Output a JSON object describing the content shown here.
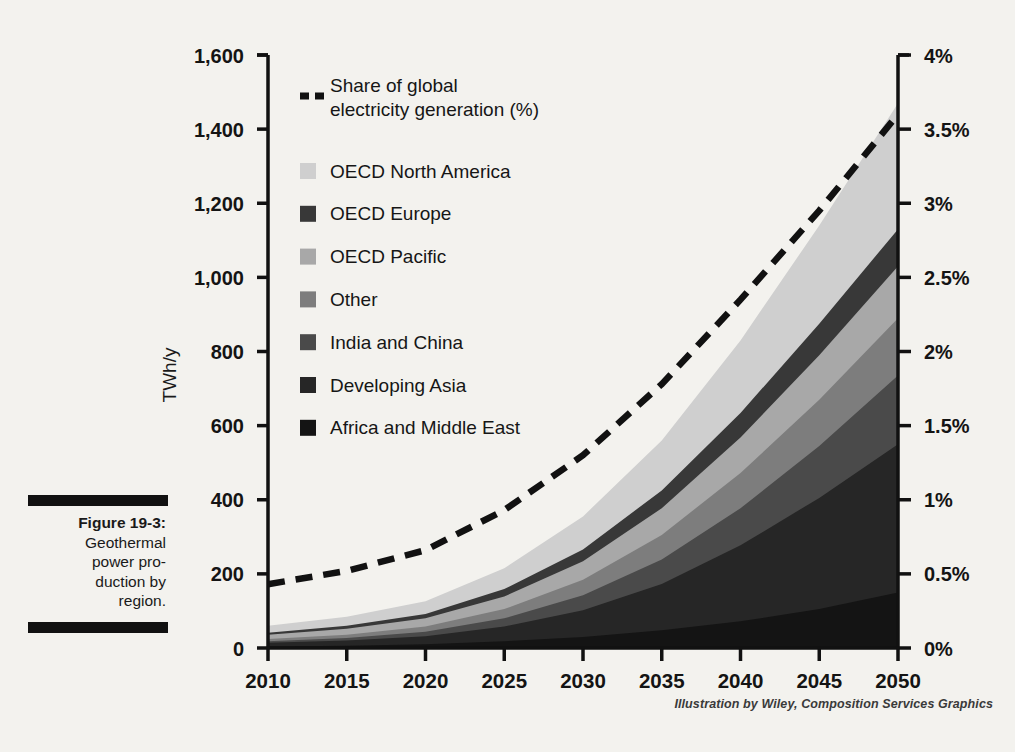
{
  "figure": {
    "label": "Figure 19-3:",
    "caption": "Geothermal power pro-duction by region.",
    "caption_lines": [
      "Geothermal",
      "power pro-",
      "duction by",
      "region."
    ],
    "credit": "Illustration by Wiley, Composition Services Graphics"
  },
  "chart_data": {
    "type": "area",
    "title": "",
    "subtitle": "",
    "stacked": true,
    "xlabel": "",
    "ylabel": "TWh/y",
    "y2label": "",
    "x": [
      2010,
      2015,
      2020,
      2025,
      2030,
      2035,
      2040,
      2045,
      2050
    ],
    "xtick_labels": [
      "2010",
      "2015",
      "2020",
      "2025",
      "2030",
      "2035",
      "2040",
      "2045",
      "2050"
    ],
    "xlim": [
      2010,
      2050
    ],
    "ylim": [
      0,
      1600
    ],
    "ytick_labels": [
      "0",
      "200",
      "400",
      "600",
      "800",
      "1,000",
      "1,200",
      "1,400",
      "1,600"
    ],
    "ytick_values": [
      0,
      200,
      400,
      600,
      800,
      1000,
      1200,
      1400,
      1600
    ],
    "y2lim": [
      0,
      4
    ],
    "y2tick_labels": [
      "0%",
      "0.5%",
      "1%",
      "1.5%",
      "2%",
      "2.5%",
      "3%",
      "3.5%",
      "4%"
    ],
    "y2tick_values": [
      0,
      0.5,
      1,
      1.5,
      2,
      2.5,
      3,
      3.5,
      4
    ],
    "grid": false,
    "legend_position": "inside-top-left",
    "series": [
      {
        "name": "Africa and Middle East",
        "color": "#141414",
        "stack_order": 1,
        "values": [
          4,
          6,
          10,
          18,
          30,
          48,
          72,
          105,
          150
        ]
      },
      {
        "name": "Developing Asia",
        "color": "#262626",
        "stack_order": 2,
        "values": [
          10,
          14,
          22,
          40,
          72,
          125,
          205,
          300,
          400
        ]
      },
      {
        "name": "India and China",
        "color": "#4a4a4a",
        "stack_order": 3,
        "values": [
          4,
          7,
          12,
          22,
          40,
          66,
          100,
          140,
          185
        ]
      },
      {
        "name": "Other",
        "color": "#7d7d7d",
        "stack_order": 4,
        "values": [
          6,
          9,
          14,
          25,
          42,
          66,
          95,
          125,
          155
        ]
      },
      {
        "name": "OECD Pacific",
        "color": "#a8a8a8",
        "stack_order": 5,
        "values": [
          12,
          16,
          22,
          34,
          50,
          72,
          96,
          120,
          140
        ]
      },
      {
        "name": "OECD Europe",
        "color": "#383838",
        "stack_order": 6,
        "values": [
          5,
          8,
          12,
          20,
          32,
          48,
          66,
          85,
          100
        ]
      },
      {
        "name": "OECD North America",
        "color": "#cfcfcf",
        "stack_order": 7,
        "values": [
          19,
          24,
          34,
          56,
          89,
          135,
          196,
          265,
          340
        ]
      }
    ],
    "line_series": {
      "name": "Share of global electricity generation (%)",
      "style": "dashed",
      "color": "#111111",
      "axis": "right",
      "unit": "%",
      "values": [
        0.43,
        0.52,
        0.66,
        0.93,
        1.3,
        1.78,
        2.35,
        2.95,
        3.6
      ]
    }
  },
  "legend": {
    "line_entry": {
      "label_line1": "Share of global",
      "label_line2": "electricity generation (%)",
      "swatch": "dashed-line"
    },
    "items": [
      {
        "label": "OECD North America",
        "color": "#cfcfcf"
      },
      {
        "label": "OECD Europe",
        "color": "#383838"
      },
      {
        "label": "OECD Pacific",
        "color": "#a8a8a8"
      },
      {
        "label": "Other",
        "color": "#7d7d7d"
      },
      {
        "label": "India and China",
        "color": "#4a4a4a"
      },
      {
        "label": "Developing Asia",
        "color": "#262626"
      },
      {
        "label": "Africa and Middle East",
        "color": "#141414"
      }
    ]
  },
  "theme": {
    "background": "#f3f2ee",
    "axis_color": "#111111",
    "text_color": "#1a1a1a"
  }
}
